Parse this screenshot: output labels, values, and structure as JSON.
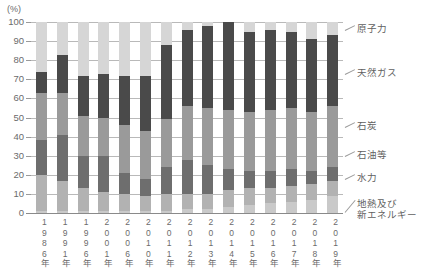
{
  "axis": {
    "unit_label": "(%)",
    "yticks": [
      "100",
      "90",
      "80",
      "70",
      "60",
      "50",
      "40",
      "30",
      "20",
      "10",
      "0"
    ],
    "ylim": [
      0,
      100
    ]
  },
  "legend": {
    "items": [
      {
        "key": "nuclear",
        "label": "原子力",
        "color": "#d6d6d6"
      },
      {
        "key": "gas",
        "label": "天然ガス",
        "color": "#4a4a4a"
      },
      {
        "key": "coal",
        "label": "石炭",
        "color": "#9a9a9a"
      },
      {
        "key": "oil",
        "label": "石油等",
        "color": "#6e6e6e"
      },
      {
        "key": "hydro",
        "label": "水力",
        "color": "#b2b2b2"
      },
      {
        "key": "geothermal",
        "label": "地熱及び",
        "label2": "新エネルギー",
        "color": "#c9c9c9"
      }
    ]
  },
  "chart_data": {
    "type": "bar",
    "subtype": "stacked-100-percent",
    "title": "",
    "xlabel": "",
    "ylabel": "(%)",
    "ylim": [
      0,
      100
    ],
    "grid": true,
    "legend_position": "right-outside",
    "categories": [
      "1986年",
      "1991年",
      "1996年",
      "2001年",
      "2006年",
      "2010年",
      "2011年",
      "2012年",
      "2013年",
      "2014年",
      "2015年",
      "2016年",
      "2017年",
      "2018年",
      "2019年"
    ],
    "series": [
      {
        "name": "地熱及び新エネルギー",
        "key": "geothermal",
        "color": "#c9c9c9",
        "values": [
          1,
          1,
          1,
          1,
          1,
          1,
          1,
          2,
          2,
          3,
          4,
          5,
          6,
          7,
          9
        ]
      },
      {
        "name": "水力",
        "key": "hydro",
        "color": "#b2b2b2",
        "values": [
          19,
          16,
          12,
          10,
          9,
          8,
          9,
          8,
          8,
          9,
          9,
          8,
          8,
          8,
          8
        ]
      },
      {
        "name": "石油等",
        "key": "oil",
        "color": "#6e6e6e",
        "values": [
          18,
          24,
          17,
          19,
          11,
          9,
          14,
          18,
          15,
          11,
          9,
          9,
          9,
          7,
          7
        ]
      },
      {
        "name": "石炭",
        "key": "coal",
        "color": "#9a9a9a",
        "values": [
          25,
          22,
          21,
          20,
          25,
          25,
          25,
          28,
          30,
          31,
          31,
          32,
          32,
          31,
          32
        ]
      },
      {
        "name": "天然ガス",
        "key": "gas",
        "color": "#4a4a4a",
        "values": [
          11,
          20,
          21,
          23,
          26,
          29,
          39,
          40,
          43,
          46,
          42,
          42,
          40,
          38,
          37
        ]
      },
      {
        "name": "原子力",
        "key": "nuclear",
        "color": "#d6d6d6",
        "values": [
          26,
          17,
          28,
          27,
          28,
          28,
          12,
          4,
          2,
          0,
          5,
          4,
          5,
          9,
          7
        ]
      }
    ]
  }
}
